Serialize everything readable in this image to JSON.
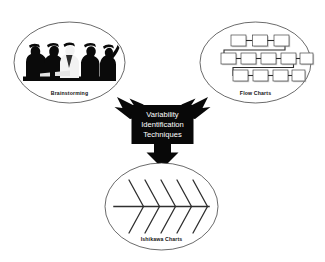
{
  "diagram": {
    "title": "Variability Identification Techniques",
    "hub": {
      "lines": [
        "Variability",
        "Identification",
        "Techniques"
      ],
      "line1": "Variability",
      "line2": "Identification",
      "line3": "Techniques",
      "fill_color": "#080808",
      "text_color": "#ffffff"
    },
    "background_color": "#ffffff",
    "outline_color": "#2b2b2b",
    "nodes": [
      {
        "id": "brainstorming",
        "label": "Brainstorming",
        "position": "top-left",
        "illustration": "meeting-silhouette",
        "arrow_direction": "up-left"
      },
      {
        "id": "flow-charts",
        "label": "Flow Charts",
        "position": "top-right",
        "illustration": "flowchart-boxes",
        "arrow_direction": "up-right",
        "box_rows": [
          3,
          5,
          4
        ]
      },
      {
        "id": "ishikawa-charts",
        "label": "Ishikawa Charts",
        "position": "bottom-center",
        "illustration": "fishbone",
        "arrow_direction": "down",
        "bone_pairs": 5
      }
    ]
  }
}
